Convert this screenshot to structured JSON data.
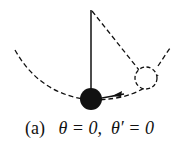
{
  "figure": {
    "label": "(a)",
    "condition_theta": "θ = 0,",
    "condition_theta_prime": "θ′ = 0",
    "colors": {
      "stroke": "#111111",
      "bob_fill": "#111111",
      "background": "#ffffff"
    }
  }
}
